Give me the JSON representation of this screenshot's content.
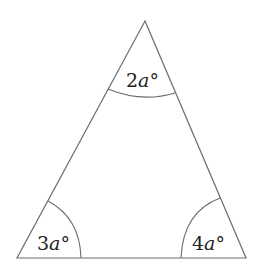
{
  "diagram": {
    "type": "triangle",
    "vertices": {
      "top": {
        "x": 145,
        "y": 21
      },
      "bottom_left": {
        "x": 17,
        "y": 258
      },
      "bottom_right": {
        "x": 246,
        "y": 258
      }
    },
    "angles": [
      {
        "id": "top",
        "coef": "2",
        "var": "a",
        "unit": "°"
      },
      {
        "id": "bottom_left",
        "coef": "3",
        "var": "a",
        "unit": "°"
      },
      {
        "id": "bottom_right",
        "coef": "4",
        "var": "a",
        "unit": "°"
      }
    ],
    "colors": {
      "line": "#6e6e6e",
      "text": "#222222",
      "background": "#ffffff"
    }
  }
}
